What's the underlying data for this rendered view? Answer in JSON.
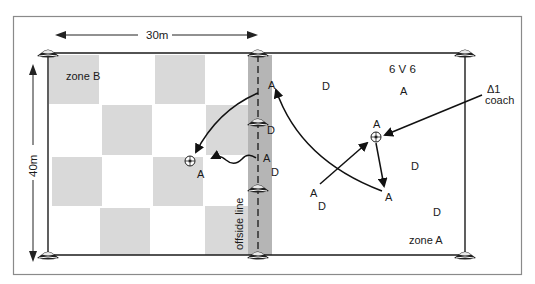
{
  "diagram": {
    "title": "6 V 6",
    "dimensions": {
      "width_label": "30m",
      "height_label": "40m"
    },
    "zones": [
      {
        "id": "zone-b",
        "label": "zone B"
      },
      {
        "id": "zone-a",
        "label": "zone A"
      }
    ],
    "offside": {
      "label": "offside line"
    },
    "coach": {
      "symbol": "Δ1",
      "label": "coach"
    },
    "players": {
      "attacker": "A",
      "defender": "D"
    },
    "labels": {
      "a_top_offside": "A",
      "d_cone_offside": "D",
      "a_mid_offside": "A",
      "d_mid_offside": "D",
      "a_ball_left": "A",
      "d_top_mid": "D",
      "a_top_right": "A",
      "a_ball_right": "A",
      "d_right_mid": "D",
      "a_bottom_left": "A",
      "d_bottom_left": "D",
      "a_bottom_mid": "A",
      "d_bottom_right": "D"
    },
    "colors": {
      "frame": "#8a8a8a",
      "line": "#1a1a1a",
      "checker": "#d9d9d9",
      "offside_band": "#b5b5b5"
    }
  }
}
